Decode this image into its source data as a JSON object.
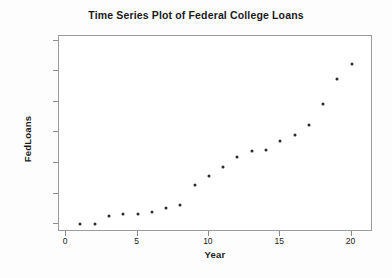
{
  "chart_data": {
    "type": "scatter",
    "title": "Time Series Plot of Federal College Loans",
    "xlabel": "Year",
    "ylabel": "FedLoans",
    "xlim": [
      -0.5,
      21.5
    ],
    "ylim": [
      7500,
      71500
    ],
    "xticks": [
      "0",
      "5",
      "10",
      "15",
      "20"
    ],
    "xtick_values": [
      0,
      5,
      10,
      15,
      20
    ],
    "yticks": [
      "10000",
      "20000",
      "30000",
      "40000",
      "50000",
      "60000",
      "70000"
    ],
    "ytick_values": [
      10000,
      20000,
      30000,
      40000,
      50000,
      60000,
      70000
    ],
    "grid": false,
    "legend": false,
    "marker": "filled-circle",
    "marker_color": "#2b2b2b",
    "x": [
      1,
      2,
      3,
      4,
      5,
      6,
      7,
      8,
      9,
      10,
      11,
      12,
      13,
      14,
      15,
      16,
      17,
      18,
      19,
      20
    ],
    "values": [
      9950,
      10100,
      12600,
      13300,
      13350,
      13950,
      15200,
      16200,
      22700,
      25900,
      28800,
      32000,
      33800,
      34400,
      37100,
      39100,
      42600,
      49300,
      57400,
      62300
    ]
  },
  "figure": {
    "background_color": "#fdfdfd",
    "plot_background_color": "#ffffff",
    "frame_color": "#9a9a9a",
    "text_color": "#1a1a1a"
  }
}
